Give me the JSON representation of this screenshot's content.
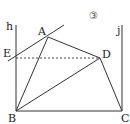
{
  "figure": {
    "number_label": "③",
    "points": {
      "A": {
        "label": "A",
        "x": 48,
        "y": 37
      },
      "B": {
        "label": "B",
        "x": 16,
        "y": 111
      },
      "C": {
        "label": "C",
        "x": 122,
        "y": 111
      },
      "D": {
        "label": "D",
        "x": 100,
        "y": 58
      },
      "E": {
        "label": "E",
        "x": 16,
        "y": 58
      }
    },
    "lines": {
      "h": {
        "label": "h"
      },
      "j": {
        "label": "j"
      }
    },
    "colors": {
      "stroke": "#333333",
      "text": "#222222"
    }
  }
}
